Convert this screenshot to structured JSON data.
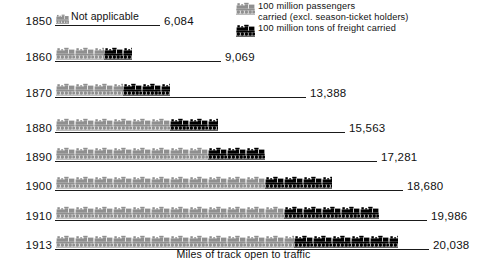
{
  "colors": {
    "passenger": "#8f8f8f",
    "freight": "#000000",
    "rule": "#1a1a1a",
    "text": "#111111",
    "background": "#ffffff"
  },
  "legend": {
    "items": [
      {
        "icon": "locomotive-icon-gray",
        "color": "#8f8f8f",
        "line1": "100  million  passengers",
        "line2": "carried (excl. season-ticket holders)"
      },
      {
        "icon": "locomotive-icon-black",
        "color": "#000000",
        "line1": "100 million  tons of freight carried",
        "line2": ""
      }
    ]
  },
  "caption": "Miles of track open to traffic",
  "not_applicable_label": "Not applicable",
  "chart_data": {
    "type": "bar",
    "title": "",
    "xlabel": "Miles of track open to traffic",
    "ylabel": "",
    "unit_per_icon": "100 million",
    "categories": [
      "1850",
      "1860",
      "1870",
      "1880",
      "1890",
      "1900",
      "1910",
      "1913"
    ],
    "series": [
      {
        "name": "100 million passengers carried (excl. season-ticket holders)",
        "color": "#8f8f8f",
        "values": [
          0,
          2.5,
          3.5,
          6,
          8,
          11,
          12,
          12.5
        ]
      },
      {
        "name": "100 million tons of freight carried",
        "color": "#000000",
        "values": [
          0,
          1.5,
          2.5,
          2.5,
          3,
          3.5,
          5,
          5.5
        ]
      }
    ],
    "annotations": [
      "6,084",
      "9,069",
      "13,388",
      "15,563",
      "17,281",
      "18,680",
      "19,986",
      "20,038"
    ],
    "legend_position": "top-right",
    "grid": false
  },
  "rows": [
    {
      "year": "1850",
      "value": "6,084",
      "passengers": 0,
      "freight": 0,
      "track_px": 105,
      "not_applicable": true
    },
    {
      "year": "1860",
      "value": "9,069",
      "passengers": 2.5,
      "freight": 1.5,
      "track_px": 166,
      "not_applicable": false
    },
    {
      "year": "1870",
      "value": "13,388",
      "passengers": 3.5,
      "freight": 2.5,
      "track_px": 251,
      "not_applicable": false
    },
    {
      "year": "1880",
      "value": "15,563",
      "passengers": 6,
      "freight": 2.5,
      "track_px": 290,
      "not_applicable": false
    },
    {
      "year": "1890",
      "value": "17,281",
      "passengers": 8,
      "freight": 3,
      "track_px": 322,
      "not_applicable": false
    },
    {
      "year": "1900",
      "value": "18,680",
      "passengers": 11,
      "freight": 3.5,
      "track_px": 348,
      "not_applicable": false
    },
    {
      "year": "1910",
      "value": "19,986",
      "passengers": 12,
      "freight": 5,
      "track_px": 372,
      "not_applicable": false
    },
    {
      "year": "1913",
      "value": "20,038",
      "passengers": 12.5,
      "freight": 5.5,
      "track_px": 374,
      "not_applicable": false
    }
  ],
  "layout": {
    "row_tops": [
      4,
      40,
      76,
      111,
      140,
      169,
      199,
      228
    ],
    "icons_left": 56,
    "track_left": 55,
    "value_gap": 4
  }
}
